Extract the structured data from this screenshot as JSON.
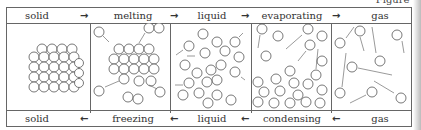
{
  "figure_label": "Figure 3",
  "top_row": {
    "states": [
      "solid",
      "liquid",
      "gas"
    ],
    "processes": [
      "melting",
      "evaporating"
    ],
    "arrow": "→"
  },
  "bottom_row": {
    "states": [
      "solid",
      "liquid",
      "gas"
    ],
    "processes": [
      "freezing",
      "condensing"
    ],
    "arrow": "←"
  },
  "panels": [
    {
      "name": "solid",
      "description": "tightly packed lattice of particles"
    },
    {
      "name": "melting",
      "description": "lattice with particles breaking away"
    },
    {
      "name": "liquid",
      "description": "close particles moving randomly"
    },
    {
      "name": "evaporating",
      "description": "particles escaping from liquid surface"
    },
    {
      "name": "gas",
      "description": "widely spaced fast-moving particles"
    }
  ],
  "colors": {
    "line": "#666666",
    "particle_stroke": "#555555",
    "background": "#ffffff"
  }
}
